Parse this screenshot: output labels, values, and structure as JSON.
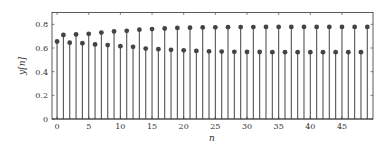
{
  "chart_data": {
    "type": "stem",
    "title": "",
    "xlabel": "n",
    "ylabel": "y[n]",
    "xlim": [
      -0.8,
      49.9
    ],
    "ylim": [
      0,
      0.9
    ],
    "grid": false,
    "legend": null,
    "x_ticks": [
      0,
      5,
      10,
      15,
      20,
      25,
      30,
      35,
      40,
      45
    ],
    "x_tick_labels": [
      "0",
      "5",
      "10",
      "15",
      "20",
      "25",
      "30",
      "35",
      "40",
      "45"
    ],
    "y_ticks": [
      0,
      0.2,
      0.4,
      0.6,
      0.8
    ],
    "y_tick_labels": [
      "0",
      "0.2",
      "0.4",
      "0.6",
      "0.8"
    ],
    "x": [
      0,
      1,
      2,
      3,
      4,
      5,
      6,
      7,
      8,
      9,
      10,
      11,
      12,
      13,
      14,
      15,
      16,
      17,
      18,
      19,
      20,
      21,
      22,
      23,
      24,
      25,
      26,
      27,
      28,
      29,
      30,
      31,
      32,
      33,
      34,
      35,
      36,
      37,
      38,
      39,
      40,
      41,
      42,
      43,
      44,
      45,
      46,
      47,
      48,
      49
    ],
    "values": [
      0.655,
      0.71,
      0.645,
      0.715,
      0.64,
      0.72,
      0.63,
      0.73,
      0.625,
      0.74,
      0.615,
      0.745,
      0.61,
      0.755,
      0.595,
      0.76,
      0.59,
      0.765,
      0.585,
      0.77,
      0.58,
      0.772,
      0.575,
      0.774,
      0.572,
      0.775,
      0.57,
      0.776,
      0.568,
      0.777,
      0.567,
      0.777,
      0.566,
      0.778,
      0.565,
      0.778,
      0.565,
      0.778,
      0.565,
      0.778,
      0.565,
      0.778,
      0.565,
      0.778,
      0.565,
      0.778,
      0.565,
      0.778,
      0.565,
      0.778
    ],
    "colors": {
      "stem": "#555555",
      "marker": "#444444",
      "axis": "#333333"
    }
  }
}
